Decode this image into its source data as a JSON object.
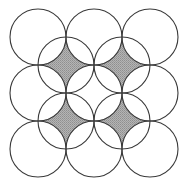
{
  "figure": {
    "type": "geometric-diagram",
    "canvas": {
      "width": 188,
      "height": 183,
      "background": "#ffffff"
    },
    "style": {
      "stroke_color": "#3a3a3a",
      "stroke_width": 1,
      "shade_color": "#a9a9a9",
      "shade_pattern": "stipple-halftone",
      "shade_dot_color": "#8d8d8d",
      "unfilled_color": "#ffffff"
    },
    "geometry": {
      "radius": 28,
      "spacing": 56,
      "open_circle_centers_x": [
        38,
        94,
        150
      ],
      "open_circle_centers_y": [
        37,
        93,
        149
      ],
      "shaded_circle_centers_x": [
        66,
        122
      ],
      "shaded_circle_centers_y": [
        65,
        121
      ],
      "open_circle_count": 9,
      "shaded_circle_count": 4,
      "total_circle_count": 13
    },
    "open_circles": [
      {
        "id": "open-r1-c1",
        "cx": 38,
        "cy": 37,
        "r": 28
      },
      {
        "id": "open-r1-c2",
        "cx": 94,
        "cy": 37,
        "r": 28
      },
      {
        "id": "open-r1-c3",
        "cx": 150,
        "cy": 37,
        "r": 28
      },
      {
        "id": "open-r2-c1",
        "cx": 38,
        "cy": 93,
        "r": 28
      },
      {
        "id": "open-r2-c2",
        "cx": 94,
        "cy": 93,
        "r": 28
      },
      {
        "id": "open-r2-c3",
        "cx": 150,
        "cy": 93,
        "r": 28
      },
      {
        "id": "open-r3-c1",
        "cx": 38,
        "cy": 149,
        "r": 28
      },
      {
        "id": "open-r3-c2",
        "cx": 94,
        "cy": 149,
        "r": 28
      },
      {
        "id": "open-r3-c3",
        "cx": 150,
        "cy": 149,
        "r": 28
      }
    ],
    "shaded_circles": [
      {
        "id": "shaded-r1-c1",
        "cx": 66,
        "cy": 65,
        "r": 28
      },
      {
        "id": "shaded-r1-c2",
        "cx": 122,
        "cy": 65,
        "r": 28
      },
      {
        "id": "shaded-r2-c1",
        "cx": 66,
        "cy": 121,
        "r": 28
      },
      {
        "id": "shaded-r2-c2",
        "cx": 122,
        "cy": 121,
        "r": 28
      }
    ]
  }
}
